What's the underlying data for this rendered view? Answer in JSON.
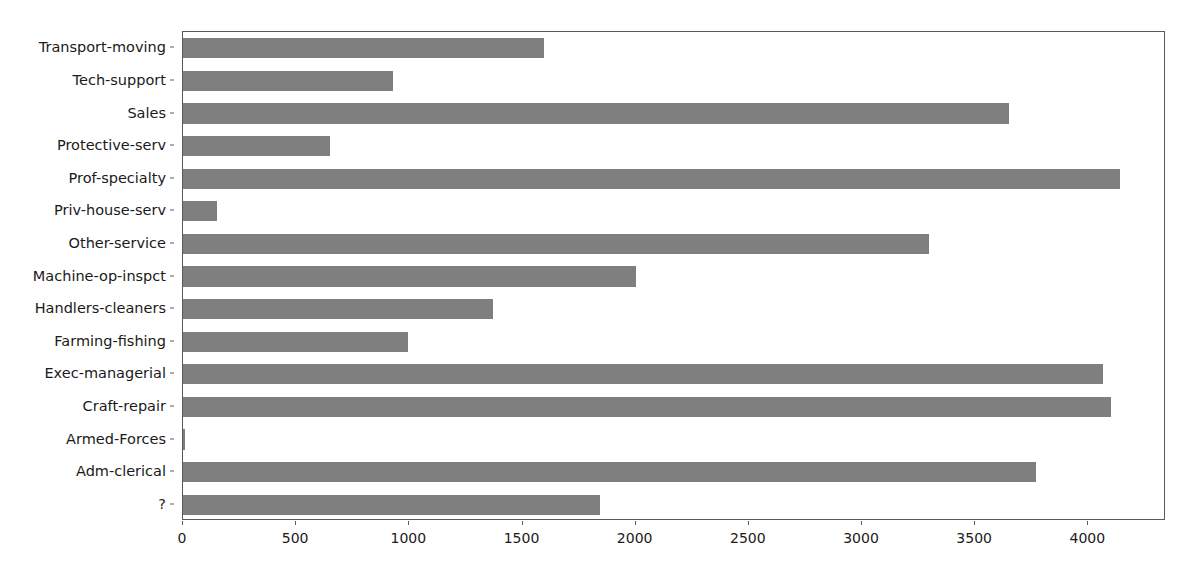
{
  "chart_data": {
    "type": "bar",
    "orientation": "horizontal",
    "title": "",
    "xlabel": "",
    "ylabel": "",
    "xlim": [
      0,
      4343
    ],
    "xticks": [
      0,
      500,
      1000,
      1500,
      2000,
      2500,
      3000,
      3500,
      4000
    ],
    "xticklabels": [
      "0",
      "500",
      "1000",
      "1500",
      "2000",
      "2500",
      "3000",
      "3500",
      "4000"
    ],
    "grid": false,
    "legend": null,
    "bar_color": "#7f7f7f",
    "categories": [
      "Transport-moving",
      "Tech-support",
      "Sales",
      "Protective-serv",
      "Prof-specialty",
      "Priv-house-serv",
      "Other-service",
      "Machine-op-inspct",
      "Handlers-cleaners",
      "Farming-fishing",
      "Exec-managerial",
      "Craft-repair",
      "Armed-Forces",
      "Adm-clerical",
      "?"
    ],
    "values": [
      1597,
      928,
      3650,
      649,
      4140,
      149,
      3295,
      2002,
      1370,
      994,
      4066,
      4099,
      9,
      3770,
      1843
    ]
  }
}
